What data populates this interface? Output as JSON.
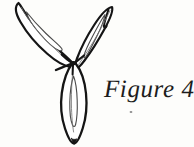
{
  "page": {
    "background_color": "#fdfdfb",
    "width": 194,
    "height": 147
  },
  "caption": {
    "text": "Figure 4",
    "color": "#1c1c1c",
    "style": "italic-serif"
  },
  "illustration": {
    "title": "three-petaled flower line drawing",
    "ink_color": "#151515",
    "fill_color": "#ffffff",
    "petal_count": 3,
    "petals": [
      {
        "name": "upper-left-petal",
        "direction": "up-left",
        "tip": [
          18,
          3
        ],
        "base": [
          72,
          64
        ],
        "has_inner_outline": true
      },
      {
        "name": "upper-right-petal",
        "direction": "up-right",
        "tip": [
          112,
          7
        ],
        "base": [
          74,
          64
        ],
        "has_inner_outline": true
      },
      {
        "name": "lower-center-petal",
        "direction": "down",
        "tip": [
          74,
          143
        ],
        "base": [
          73,
          64
        ],
        "has_inner_outline": true
      }
    ],
    "center_junction": [
      73,
      63
    ],
    "speck": [
      131,
      112
    ]
  }
}
